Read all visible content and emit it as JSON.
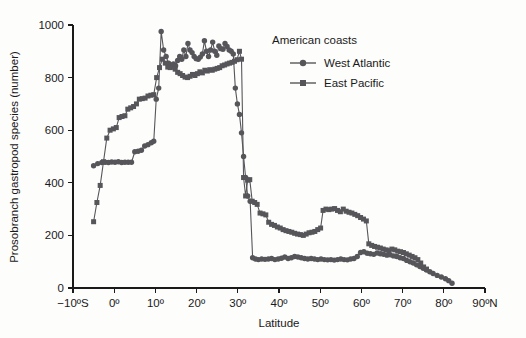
{
  "figure": {
    "background_color": "#fdfdfc",
    "series_color": "#56565a",
    "axis_color": "#1a1a1a"
  },
  "axes": {
    "x": {
      "label": "Latitude",
      "tick_labels": [
        "−10ºS",
        "0º",
        "10º",
        "20º",
        "30º",
        "40º",
        "50º",
        "60º",
        "70º",
        "80º",
        "90ºN"
      ],
      "tick_values": [
        -10,
        0,
        10,
        20,
        30,
        40,
        50,
        60,
        70,
        80,
        90
      ],
      "range": [
        -10,
        90
      ]
    },
    "y": {
      "label": "Prosobranch gastropod species (number)",
      "tick_labels": [
        "0",
        "200",
        "400",
        "600",
        "800",
        "1000"
      ],
      "tick_values": [
        0,
        200,
        400,
        600,
        800,
        1000
      ],
      "range": [
        0,
        1000
      ]
    }
  },
  "legend": {
    "title": "American coasts",
    "position": "upper-right-inside",
    "entries": [
      {
        "label": "West Atlantic",
        "marker": "circle",
        "color": "#56565a"
      },
      {
        "label": "East Pacific",
        "marker": "square",
        "color": "#56565a"
      }
    ]
  },
  "chart_data": {
    "type": "line",
    "title": "",
    "subtitle": "",
    "xlabel": "Latitude",
    "ylabel": "Prosobranch gastropod species (number)",
    "xlim": [
      -10,
      90
    ],
    "ylim": [
      0,
      1000
    ],
    "grid": false,
    "legend_position": "upper-right-inside",
    "legend_title": "American coasts",
    "annotations": [],
    "series": [
      {
        "name": "West Atlantic",
        "marker": "circle",
        "color": "#56565a",
        "points": [
          [
            -5.0,
            465
          ],
          [
            -4.0,
            473
          ],
          [
            -3.0,
            477
          ],
          [
            -2.2,
            478
          ],
          [
            -1.4,
            477
          ],
          [
            -0.6,
            479
          ],
          [
            0.2,
            478
          ],
          [
            1.0,
            480
          ],
          [
            1.8,
            477
          ],
          [
            2.6,
            478
          ],
          [
            3.4,
            478
          ],
          [
            4.2,
            478
          ],
          [
            5.0,
            518
          ],
          [
            5.8,
            520
          ],
          [
            6.6,
            524
          ],
          [
            7.4,
            540
          ],
          [
            8.2,
            545
          ],
          [
            9.0,
            552
          ],
          [
            9.6,
            558
          ],
          [
            10.2,
            718
          ],
          [
            10.8,
            760
          ],
          [
            11.4,
            975
          ],
          [
            12.0,
            905
          ],
          [
            12.6,
            880
          ],
          [
            13.2,
            855
          ],
          [
            13.8,
            848
          ],
          [
            14.4,
            852
          ],
          [
            14.9,
            845
          ],
          [
            15.4,
            865
          ],
          [
            15.9,
            880
          ],
          [
            16.4,
            870
          ],
          [
            16.9,
            905
          ],
          [
            17.4,
            880
          ],
          [
            17.9,
            930
          ],
          [
            18.4,
            905
          ],
          [
            18.9,
            895
          ],
          [
            19.4,
            880
          ],
          [
            19.9,
            872
          ],
          [
            20.4,
            870
          ],
          [
            20.9,
            878
          ],
          [
            21.4,
            890
          ],
          [
            21.9,
            940
          ],
          [
            22.4,
            900
          ],
          [
            22.9,
            880
          ],
          [
            23.4,
            905
          ],
          [
            23.9,
            935
          ],
          [
            24.4,
            900
          ],
          [
            24.9,
            885
          ],
          [
            25.4,
            920
          ],
          [
            25.9,
            910
          ],
          [
            26.4,
            908
          ],
          [
            26.9,
            930
          ],
          [
            27.4,
            918
          ],
          [
            27.9,
            905
          ],
          [
            28.4,
            900
          ],
          [
            28.9,
            890
          ],
          [
            29.4,
            760
          ],
          [
            29.9,
            700
          ],
          [
            30.4,
            660
          ],
          [
            30.9,
            590
          ],
          [
            31.4,
            500
          ],
          [
            31.9,
            420
          ],
          [
            32.4,
            350
          ],
          [
            33.0,
            330
          ],
          [
            33.6,
            115
          ],
          [
            34.3,
            110
          ],
          [
            35.0,
            108
          ],
          [
            35.8,
            110
          ],
          [
            36.6,
            109
          ],
          [
            37.4,
            110
          ],
          [
            38.2,
            112
          ],
          [
            39.0,
            108
          ],
          [
            39.8,
            110
          ],
          [
            40.6,
            113
          ],
          [
            41.4,
            118
          ],
          [
            42.2,
            112
          ],
          [
            43.0,
            115
          ],
          [
            43.8,
            120
          ],
          [
            44.6,
            118
          ],
          [
            45.4,
            115
          ],
          [
            46.2,
            112
          ],
          [
            47.0,
            110
          ],
          [
            47.8,
            112
          ],
          [
            48.6,
            110
          ],
          [
            49.4,
            108
          ],
          [
            50.2,
            110
          ],
          [
            51.0,
            108
          ],
          [
            51.8,
            107
          ],
          [
            52.6,
            108
          ],
          [
            53.4,
            106
          ],
          [
            54.2,
            108
          ],
          [
            55.0,
            110
          ],
          [
            55.8,
            108
          ],
          [
            56.6,
            107
          ],
          [
            57.4,
            110
          ],
          [
            58.2,
            112
          ],
          [
            59.0,
            120
          ],
          [
            59.8,
            135
          ],
          [
            60.6,
            138
          ],
          [
            61.4,
            132
          ],
          [
            62.2,
            130
          ],
          [
            63.0,
            128
          ],
          [
            63.8,
            133
          ],
          [
            64.6,
            130
          ],
          [
            65.4,
            128
          ],
          [
            66.2,
            125
          ],
          [
            67.0,
            126
          ],
          [
            67.8,
            122
          ],
          [
            68.6,
            120
          ],
          [
            69.4,
            115
          ],
          [
            70.2,
            112
          ],
          [
            71.0,
            105
          ],
          [
            71.8,
            100
          ],
          [
            72.6,
            95
          ],
          [
            73.4,
            88
          ],
          [
            74.2,
            82
          ],
          [
            75.0,
            75
          ],
          [
            75.8,
            68
          ],
          [
            76.6,
            62
          ],
          [
            77.4,
            55
          ],
          [
            78.4,
            48
          ],
          [
            79.4,
            42
          ],
          [
            80.4,
            35
          ],
          [
            81.2,
            28
          ],
          [
            82.0,
            18
          ]
        ]
      },
      {
        "name": "East Pacific",
        "marker": "square",
        "color": "#56565a",
        "points": [
          [
            -5.0,
            252
          ],
          [
            -4.2,
            325
          ],
          [
            -3.4,
            390
          ],
          [
            -2.6,
            480
          ],
          [
            -1.8,
            570
          ],
          [
            -1.0,
            600
          ],
          [
            -0.2,
            605
          ],
          [
            0.5,
            610
          ],
          [
            1.2,
            648
          ],
          [
            1.9,
            652
          ],
          [
            2.6,
            655
          ],
          [
            3.3,
            680
          ],
          [
            4.0,
            685
          ],
          [
            4.7,
            690
          ],
          [
            5.4,
            700
          ],
          [
            6.1,
            718
          ],
          [
            6.8,
            720
          ],
          [
            7.5,
            722
          ],
          [
            8.2,
            730
          ],
          [
            8.9,
            733
          ],
          [
            9.6,
            735
          ],
          [
            10.3,
            800
          ],
          [
            11.0,
            838
          ],
          [
            11.7,
            870
          ],
          [
            12.4,
            855
          ],
          [
            13.0,
            840
          ],
          [
            13.6,
            838
          ],
          [
            14.2,
            840
          ],
          [
            14.8,
            832
          ],
          [
            15.4,
            820
          ],
          [
            16.0,
            815
          ],
          [
            16.6,
            808
          ],
          [
            17.2,
            802
          ],
          [
            17.8,
            800
          ],
          [
            18.4,
            805
          ],
          [
            19.0,
            812
          ],
          [
            19.6,
            808
          ],
          [
            20.2,
            815
          ],
          [
            20.8,
            822
          ],
          [
            21.4,
            818
          ],
          [
            22.0,
            828
          ],
          [
            22.6,
            825
          ],
          [
            23.2,
            830
          ],
          [
            23.8,
            828
          ],
          [
            24.4,
            832
          ],
          [
            25.0,
            835
          ],
          [
            25.6,
            838
          ],
          [
            26.2,
            845
          ],
          [
            26.8,
            848
          ],
          [
            27.4,
            852
          ],
          [
            28.0,
            855
          ],
          [
            28.6,
            858
          ],
          [
            29.2,
            862
          ],
          [
            29.8,
            868
          ],
          [
            30.4,
            900
          ],
          [
            30.9,
            870
          ],
          [
            31.4,
            420
          ],
          [
            31.9,
            350
          ],
          [
            32.4,
            410
          ],
          [
            32.9,
            412
          ],
          [
            33.5,
            330
          ],
          [
            34.1,
            325
          ],
          [
            34.7,
            318
          ],
          [
            35.4,
            285
          ],
          [
            36.1,
            282
          ],
          [
            36.8,
            278
          ],
          [
            37.5,
            250
          ],
          [
            38.2,
            242
          ],
          [
            38.9,
            238
          ],
          [
            39.6,
            232
          ],
          [
            40.3,
            228
          ],
          [
            41.0,
            222
          ],
          [
            41.7,
            218
          ],
          [
            42.4,
            215
          ],
          [
            43.1,
            212
          ],
          [
            43.8,
            208
          ],
          [
            44.5,
            205
          ],
          [
            45.2,
            203
          ],
          [
            45.9,
            200
          ],
          [
            46.6,
            205
          ],
          [
            47.3,
            210
          ],
          [
            48.0,
            212
          ],
          [
            48.7,
            215
          ],
          [
            49.4,
            222
          ],
          [
            50.1,
            228
          ],
          [
            50.7,
            295
          ],
          [
            51.4,
            300
          ],
          [
            52.1,
            298
          ],
          [
            52.8,
            300
          ],
          [
            53.5,
            302
          ],
          [
            54.2,
            295
          ],
          [
            54.9,
            290
          ],
          [
            55.6,
            300
          ],
          [
            56.3,
            292
          ],
          [
            57.0,
            288
          ],
          [
            57.7,
            285
          ],
          [
            58.4,
            280
          ],
          [
            59.1,
            275
          ],
          [
            59.8,
            268
          ],
          [
            60.5,
            262
          ],
          [
            61.2,
            255
          ],
          [
            61.8,
            168
          ],
          [
            62.5,
            162
          ],
          [
            63.2,
            158
          ],
          [
            63.9,
            155
          ],
          [
            64.6,
            152
          ],
          [
            65.3,
            148
          ],
          [
            66.0,
            145
          ],
          [
            66.7,
            142
          ],
          [
            67.4,
            148
          ],
          [
            68.1,
            145
          ],
          [
            68.8,
            140
          ],
          [
            69.5,
            138
          ],
          [
            70.2,
            135
          ],
          [
            70.9,
            130
          ],
          [
            71.6,
            125
          ],
          [
            72.3,
            120
          ],
          [
            73.0,
            115
          ],
          [
            73.7,
            108
          ],
          [
            74.4,
            95
          ],
          [
            75.1,
            80
          ],
          [
            75.8,
            72
          ]
        ]
      }
    ]
  }
}
